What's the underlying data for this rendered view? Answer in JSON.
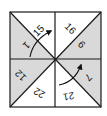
{
  "diagram": {
    "type": "square-divided-into-eight-triangles",
    "colors": {
      "border": "#1a1a1a",
      "shaded": "#d9d9d9",
      "white": "#ffffff",
      "text": "#111111"
    },
    "triangles": [
      {
        "id": "top-left-upper",
        "label": "15",
        "shaded": false
      },
      {
        "id": "top-left-lower",
        "label": "1",
        "shaded": true
      },
      {
        "id": "top-right-upper",
        "label": "16",
        "shaded": false
      },
      {
        "id": "top-right-lower",
        "label": "9",
        "shaded": true
      },
      {
        "id": "bottom-left-upper",
        "label": "12",
        "shaded": true
      },
      {
        "id": "bottom-left-lower",
        "label": "22",
        "shaded": false
      },
      {
        "id": "bottom-right-upper",
        "label": "7",
        "shaded": true
      },
      {
        "id": "bottom-right-lower",
        "label": "21",
        "shaded": false
      }
    ],
    "arrows": [
      {
        "id": "arrow-top-left",
        "from": "1",
        "to": "15"
      },
      {
        "id": "arrow-bottom-right",
        "from": "21",
        "to": "7"
      }
    ]
  }
}
